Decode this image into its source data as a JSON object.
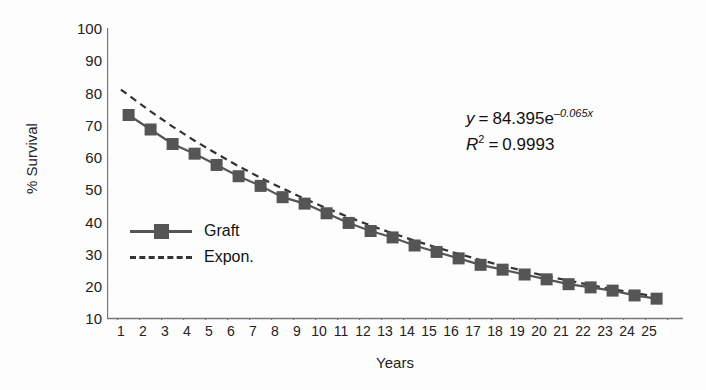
{
  "chart_data": {
    "type": "line",
    "title": "",
    "xlabel": "Years",
    "ylabel": "% Survival",
    "xlim": [
      0,
      26
    ],
    "ylim": [
      10,
      100
    ],
    "grid": false,
    "legend_position": "inside-left",
    "categories": [
      1,
      2,
      3,
      4,
      5,
      6,
      7,
      8,
      9,
      10,
      11,
      12,
      13,
      14,
      15,
      16,
      17,
      18,
      19,
      20,
      21,
      22,
      23,
      24,
      25
    ],
    "xticklabels": [
      "1",
      "2",
      "3",
      "4",
      "5",
      "6",
      "7",
      "8",
      "9",
      "10",
      "11",
      "12",
      "13",
      "14",
      "15",
      "16",
      "17",
      "18",
      "19",
      "20",
      "21",
      "22",
      "23",
      "24",
      "25"
    ],
    "yticklabels": [
      "100",
      "90",
      "80",
      "70",
      "60",
      "50",
      "40",
      "30",
      "20",
      "10"
    ],
    "yticks": [
      100,
      90,
      80,
      70,
      60,
      50,
      40,
      30,
      20,
      10
    ],
    "series": [
      {
        "name": "Graft",
        "style": "solid-with-square-markers",
        "color": "#555555",
        "values": [
          73.0,
          68.5,
          64.0,
          61.0,
          57.5,
          54.0,
          51.0,
          47.5,
          45.5,
          42.5,
          39.5,
          37.0,
          35.0,
          32.5,
          30.5,
          28.5,
          26.5,
          25.0,
          23.5,
          22.0,
          20.5,
          19.5,
          18.5,
          17.0,
          16.0
        ]
      },
      {
        "name": "Expon.",
        "style": "dashed",
        "color": "#333333",
        "equation": "y = 84.395e^(-0.065x)",
        "a": 84.395,
        "b": -0.065,
        "r_squared": 0.9993,
        "values": [
          79.1,
          74.1,
          69.4,
          65.0,
          61.0,
          57.1,
          53.5,
          50.2,
          47.0,
          44.1,
          41.3,
          38.7,
          36.3,
          34.0,
          31.9,
          29.9,
          28.0,
          26.2,
          24.6,
          23.0,
          21.6,
          20.2,
          18.9,
          17.8,
          16.6
        ]
      }
    ],
    "annotations": [
      {
        "name": "regression-equation",
        "line1_prefix": "y",
        "line1_equals": "=",
        "line1_coefficient": "84.395e",
        "line1_exponent": "–0.065x",
        "line2_prefix": "R",
        "line2_superscript": "2",
        "line2_equals": "=",
        "line2_value": "0.9993"
      }
    ]
  },
  "legend": {
    "items": [
      {
        "label": "Graft"
      },
      {
        "label": "Expon."
      }
    ]
  },
  "axes": {
    "y_title": "% Survival",
    "x_title": "Years"
  },
  "colors": {
    "marker": "#555555",
    "line": "#555555",
    "trend": "#333333",
    "axis": "#777777",
    "text": "#222222",
    "background": "#fdfdfd"
  }
}
